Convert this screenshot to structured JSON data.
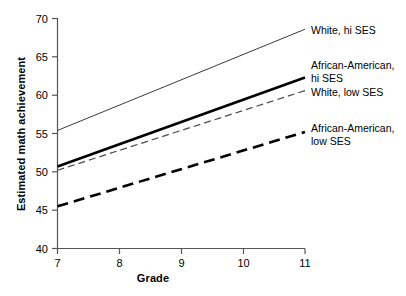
{
  "chart_data": {
    "type": "line",
    "title": "",
    "xlabel": "Grade",
    "ylabel": "Estimated math achievement",
    "x": [
      7,
      11
    ],
    "xlim": [
      7,
      11
    ],
    "ylim": [
      40,
      70
    ],
    "xticks": [
      "7",
      "8",
      "9",
      "10",
      "11"
    ],
    "yticks": [
      "40",
      "45",
      "50",
      "55",
      "60",
      "65",
      "70"
    ],
    "grid": false,
    "legend_position": "right-inline-labels",
    "series": [
      {
        "name": "White, hi SES",
        "label_lines": [
          "White, hi SES"
        ],
        "values": [
          55.4,
          68.6
        ],
        "style": "thin-solid",
        "color": "#3a3a3a",
        "width": 1,
        "dash": "none"
      },
      {
        "name": "African-American, hi SES",
        "label_lines": [
          "African-American,",
          "hi SES"
        ],
        "values": [
          50.7,
          62.3
        ],
        "style": "thick-solid",
        "color": "#000000",
        "width": 2.6,
        "dash": "none"
      },
      {
        "name": "White, low SES",
        "label_lines": [
          "White, low SES"
        ],
        "values": [
          50.2,
          60.6
        ],
        "style": "thin-dashed",
        "color": "#4a4a4a",
        "width": 1.2,
        "dash": "7,4"
      },
      {
        "name": "African-American, low SES",
        "label_lines": [
          "African-American,",
          "low SES"
        ],
        "values": [
          45.5,
          55.2
        ],
        "style": "thick-dashed",
        "color": "#000000",
        "width": 2.6,
        "dash": "11,6"
      }
    ]
  },
  "labels": {
    "white_hi": "White, hi SES",
    "aa_hi_line1": "African-American,",
    "aa_hi_line2": "hi SES",
    "white_low": "White, low SES",
    "aa_low_line1": "African-American,",
    "aa_low_line2": "low SES"
  },
  "axes": {
    "x_title": "Grade",
    "y_title": "Estimated math achievement",
    "x_tick_0": "7",
    "x_tick_1": "8",
    "x_tick_2": "9",
    "x_tick_3": "10",
    "x_tick_4": "11",
    "y_tick_0": "40",
    "y_tick_1": "45",
    "y_tick_2": "50",
    "y_tick_3": "55",
    "y_tick_4": "60",
    "y_tick_5": "65",
    "y_tick_6": "70"
  }
}
